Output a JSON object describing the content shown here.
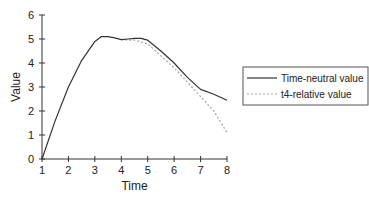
{
  "chart_data": {
    "type": "line",
    "title": "",
    "xlabel": "Time",
    "ylabel": "Value",
    "xlim": [
      1,
      8
    ],
    "ylim": [
      0,
      6
    ],
    "x_ticks": [
      "1",
      "2",
      "3",
      "4",
      "5",
      "6",
      "7",
      "8"
    ],
    "y_ticks": [
      "0",
      "1",
      "2",
      "3",
      "4",
      "5",
      "6"
    ],
    "grid": false,
    "legend_position": "right",
    "series": [
      {
        "name": "Time-neutral value",
        "style": "solid",
        "color": "#333333",
        "x": [
          1,
          1.5,
          2,
          2.5,
          3,
          3.25,
          3.5,
          3.75,
          4,
          4.25,
          4.5,
          4.75,
          5,
          5.5,
          6,
          6.5,
          7,
          7.5,
          8
        ],
        "y": [
          0,
          1.6,
          3.0,
          4.1,
          4.9,
          5.1,
          5.1,
          5.05,
          4.97,
          5.0,
          5.03,
          5.03,
          4.95,
          4.5,
          4.0,
          3.4,
          2.9,
          2.7,
          2.45
        ]
      },
      {
        "name": "t4-relative value",
        "style": "dotted",
        "color": "#aaaaaa",
        "x": [
          4,
          4.5,
          5,
          5.5,
          6,
          6.5,
          7,
          7.5,
          8
        ],
        "y": [
          4.97,
          4.95,
          4.8,
          4.3,
          3.8,
          3.2,
          2.6,
          2.0,
          1.1
        ]
      }
    ]
  }
}
